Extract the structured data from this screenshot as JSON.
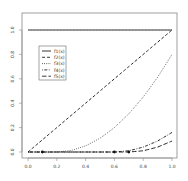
{
  "chart_data": {
    "type": "line",
    "title": "",
    "xlabel": "",
    "ylabel": "",
    "xlim": [
      0.0,
      1.0
    ],
    "ylim": [
      0.0,
      1.0
    ],
    "grid": false,
    "legend_position": "upper-left-inside",
    "x_ticks": [
      "0.0",
      "0.2",
      "0.4",
      "0.6",
      "0.8",
      "1.0"
    ],
    "y_ticks": [
      "0.0",
      "0.2",
      "0.4",
      "0.6",
      "0.8",
      "1.0"
    ],
    "x": [
      0.0,
      0.1,
      0.2,
      0.3,
      0.4,
      0.5,
      0.6,
      0.7,
      0.8,
      0.9,
      1.0
    ],
    "series": [
      {
        "name": "f1(x)",
        "style": "solid",
        "values": [
          1.0,
          1.0,
          1.0,
          1.0,
          1.0,
          1.0,
          1.0,
          1.0,
          1.0,
          1.0,
          1.0
        ]
      },
      {
        "name": "f2(x)",
        "style": "dashed",
        "values": [
          0.0,
          0.1,
          0.2,
          0.3,
          0.4,
          0.5,
          0.6,
          0.7,
          0.8,
          0.9,
          1.0
        ]
      },
      {
        "name": "f3(x)",
        "style": "dotted",
        "values": [
          0.0,
          0.0,
          0.0,
          0.0125,
          0.05,
          0.1125,
          0.2,
          0.3125,
          0.45,
          0.6125,
          0.8
        ]
      },
      {
        "name": "f4(x)",
        "style": "dotdash",
        "values": [
          0.0,
          0.0,
          0.0,
          0.0,
          0.0,
          0.0,
          0.0,
          0.01,
          0.04,
          0.09,
          0.16
        ]
      },
      {
        "name": "f5(x)",
        "style": "longdash",
        "values": [
          0.0,
          0.0,
          0.0,
          0.0,
          0.0,
          0.0,
          0.0,
          0.0,
          0.01,
          0.04,
          0.09
        ]
      }
    ],
    "markers": [
      {
        "x": 0.1,
        "y": 0.0
      },
      {
        "x": 0.6,
        "y": 0.0
      },
      {
        "x": 0.7,
        "y": 0.0
      }
    ]
  }
}
